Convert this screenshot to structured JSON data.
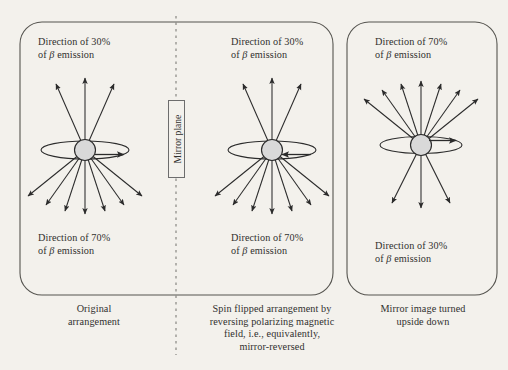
{
  "figure": {
    "type": "parity-violation-beta-emission-diagram",
    "background_color": "#f3f1ec",
    "ink_color": "#2b2b2b",
    "nucleus_fill": "#d9d9d9"
  },
  "mirror_plane": {
    "label": "Mirror plane",
    "x": 176,
    "line_style": "dashed",
    "orientation": "vertical"
  },
  "panels": [
    {
      "id": "original",
      "top_label": "Direction of 30%\nof β emission",
      "top_label_percent": "30%",
      "bottom_label": "Direction of 70%\nof β emission",
      "bottom_label_percent": "70%",
      "caption": "Original\narrangement",
      "spin_direction": "right",
      "arrows_up": 3,
      "arrows_down": 7,
      "center_x": 85,
      "center_y": 150
    },
    {
      "id": "spin-flipped",
      "top_label": "Direction of 30%\nof β emission",
      "top_label_percent": "30%",
      "bottom_label": "Direction of 70%\nof β emission",
      "bottom_label_percent": "70%",
      "caption": "Spin flipped arrangement by\nreversing polarizing magnetic\nfield, i.e., equivalently,\nmirror-reversed",
      "spin_direction": "left",
      "arrows_up": 3,
      "arrows_down": 7,
      "center_x": 272,
      "center_y": 150
    },
    {
      "id": "mirror-upside-down",
      "top_label": "Direction of 70%\nof β emission",
      "top_label_percent": "70%",
      "bottom_label": "Direction of 30%\nof β emission",
      "bottom_label_percent": "30%",
      "caption": "Mirror image turned\nupside down",
      "spin_direction": "right",
      "arrows_up": 7,
      "arrows_down": 3,
      "center_x": 421,
      "center_y": 145
    }
  ],
  "boxes": [
    {
      "id": "left-pair-box",
      "x": 20,
      "y": 22,
      "w": 313,
      "h": 273,
      "radius": 22
    },
    {
      "id": "right-box",
      "x": 347,
      "y": 22,
      "w": 150,
      "h": 273,
      "radius": 22
    }
  ]
}
